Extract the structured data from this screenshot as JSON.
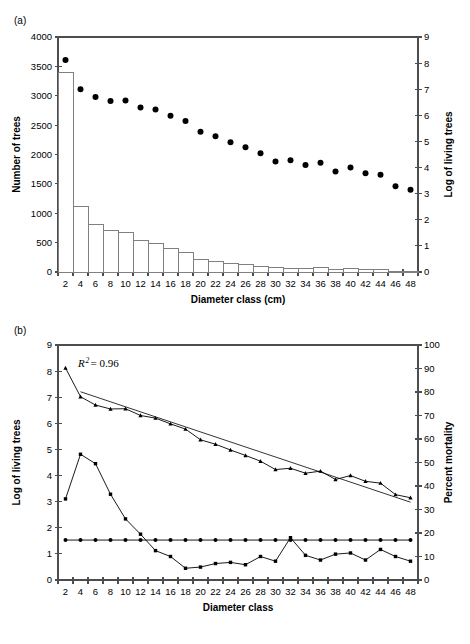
{
  "figure": {
    "panel_a_label": "(a)",
    "panel_b_label": "(b)"
  },
  "chart_data": [
    {
      "id": "panel-a",
      "type": "bar",
      "title": "",
      "panel_label": "(a)",
      "xlabel": "Diameter class (cm)",
      "ylabel": "Number of trees",
      "y2label": "Log of living trees",
      "xlim": [
        1,
        49
      ],
      "ylim": [
        0,
        4000
      ],
      "y2lim": [
        0,
        9
      ],
      "grid": false,
      "legend": "none",
      "xticks": [
        2,
        4,
        6,
        8,
        10,
        12,
        14,
        16,
        18,
        20,
        22,
        24,
        26,
        28,
        30,
        32,
        34,
        36,
        38,
        40,
        42,
        44,
        46,
        48
      ],
      "xticklabels": [
        "2",
        "4",
        "6",
        "8",
        "10",
        "12",
        "14",
        "16",
        "18",
        "20",
        "22",
        "24",
        "26",
        "28",
        "30",
        "32",
        "34",
        "36",
        "38",
        "40",
        "42",
        "44",
        "46",
        "48"
      ],
      "yticks": [
        0,
        500,
        1000,
        1500,
        2000,
        2500,
        3000,
        3500,
        4000
      ],
      "yticklabels": [
        "0",
        "500",
        "1000",
        "1500",
        "2000",
        "2500",
        "3000",
        "3500",
        "4000"
      ],
      "y2ticks": [
        0,
        1,
        2,
        3,
        4,
        5,
        6,
        7,
        8,
        9
      ],
      "y2ticklabels": [
        "0",
        "1",
        "2",
        "3",
        "4",
        "5",
        "6",
        "7",
        "8",
        "9"
      ],
      "categories": [
        2,
        4,
        6,
        8,
        10,
        12,
        14,
        16,
        18,
        20,
        22,
        24,
        26,
        28,
        30,
        32,
        34,
        36,
        38,
        40,
        42,
        44,
        46,
        48
      ],
      "series": [
        {
          "name": "Number of trees",
          "axis": "left",
          "marker": "bar",
          "values": [
            3390,
            1120,
            805,
            700,
            680,
            540,
            490,
            400,
            335,
            215,
            175,
            150,
            120,
            95,
            70,
            65,
            62,
            75,
            45,
            65,
            50,
            40,
            5,
            5
          ]
        },
        {
          "name": "Log of living trees",
          "axis": "right",
          "marker": "circle",
          "values": [
            8.12,
            7.0,
            6.7,
            6.55,
            6.57,
            6.3,
            6.22,
            5.98,
            5.78,
            5.37,
            5.2,
            4.97,
            4.78,
            4.55,
            4.23,
            4.28,
            4.1,
            4.18,
            3.85,
            4.0,
            3.78,
            3.72,
            3.28,
            3.15
          ]
        }
      ]
    },
    {
      "id": "panel-b",
      "type": "line",
      "title": "",
      "panel_label": "(b)",
      "xlabel": "Diameter class",
      "ylabel": "Log of living trees",
      "y2label": "Percent mortality",
      "xlim": [
        1,
        49
      ],
      "ylim": [
        0,
        9
      ],
      "y2lim": [
        0,
        100
      ],
      "grid": false,
      "legend": "none",
      "annotation": "R2 = 0.96",
      "annotation_r": "R",
      "annotation_sup": "2",
      "annotation_value": "= 0.96",
      "xticks": [
        2,
        4,
        6,
        8,
        10,
        12,
        14,
        16,
        18,
        20,
        22,
        24,
        26,
        28,
        30,
        32,
        34,
        36,
        38,
        40,
        42,
        44,
        46,
        48
      ],
      "xticklabels": [
        "2",
        "4",
        "6",
        "8",
        "10",
        "12",
        "14",
        "16",
        "18",
        "20",
        "22",
        "24",
        "26",
        "28",
        "30",
        "32",
        "34",
        "36",
        "38",
        "40",
        "42",
        "44",
        "46",
        "48"
      ],
      "yticks": [
        0,
        1,
        2,
        3,
        4,
        5,
        6,
        7,
        8,
        9
      ],
      "yticklabels": [
        "0",
        "1",
        "2",
        "3",
        "4",
        "5",
        "6",
        "7",
        "8",
        "9"
      ],
      "y2ticks": [
        0,
        10,
        20,
        30,
        40,
        50,
        60,
        70,
        80,
        90,
        100
      ],
      "y2ticklabels": [
        "0",
        "10",
        "20",
        "30",
        "40",
        "50",
        "60",
        "70",
        "80",
        "90",
        "100"
      ],
      "categories": [
        2,
        4,
        6,
        8,
        10,
        12,
        14,
        16,
        18,
        20,
        22,
        24,
        26,
        28,
        30,
        32,
        34,
        36,
        38,
        40,
        42,
        44,
        46,
        48
      ],
      "series": [
        {
          "name": "Log of living trees",
          "axis": "left",
          "marker": "triangle",
          "values": [
            8.12,
            7.02,
            6.7,
            6.55,
            6.56,
            6.3,
            6.2,
            5.98,
            5.78,
            5.37,
            5.2,
            4.98,
            4.77,
            4.55,
            4.23,
            4.28,
            4.09,
            4.17,
            3.85,
            4.0,
            3.78,
            3.71,
            3.27,
            3.15
          ]
        },
        {
          "name": "Percent mortality",
          "axis": "right",
          "marker": "square",
          "values": [
            34.5,
            53.5,
            49.5,
            36.5,
            26.0,
            19.5,
            12.5,
            10.0,
            5.0,
            5.5,
            7.0,
            7.5,
            6.5,
            10.0,
            8.0,
            18.0,
            10.5,
            8.5,
            11.0,
            11.5,
            8.5,
            13.0,
            10.0,
            8.0
          ]
        },
        {
          "name": "Mean percent mortality",
          "axis": "right",
          "marker": "circle",
          "values": [
            17.0,
            17.0,
            17.0,
            17.0,
            17.0,
            17.0,
            17.0,
            17.0,
            17.0,
            17.0,
            17.0,
            17.0,
            17.0,
            17.0,
            17.0,
            17.0,
            17.0,
            17.0,
            17.0,
            17.0,
            17.0,
            17.0,
            17.0,
            17.0
          ]
        }
      ],
      "trendline": {
        "name": "Linear regression",
        "axis": "left",
        "x": [
          4,
          48
        ],
        "y": [
          7.21,
          2.98
        ],
        "r_squared": 0.96
      }
    }
  ]
}
